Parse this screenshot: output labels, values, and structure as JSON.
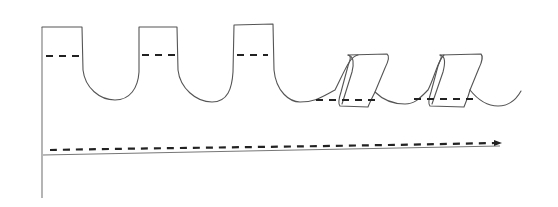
{
  "diagram": {
    "type": "hand-drawn sketch",
    "colors": {
      "background": "#ffffff",
      "outline": "#555555",
      "dash": "#222222"
    },
    "elements": {
      "u_grooves": 3,
      "slanted_folds": 2,
      "dashed_levels_in_teeth": 3,
      "dashed_levels_in_folds": 2,
      "dashed_arrow": "left-to-right, slightly rising"
    }
  }
}
